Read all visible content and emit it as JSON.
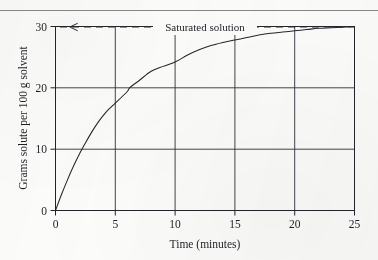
{
  "figure": {
    "background_color": "#fcfcfa",
    "ink_color": "#23232a",
    "top_rule_color": "#6f6f70"
  },
  "chart_data": {
    "type": "line",
    "title": "",
    "subtitle": "",
    "xlabel": "Time (minutes)",
    "ylabel": "Grams solute per 100 g solvent",
    "xlim": [
      0,
      25
    ],
    "ylim": [
      0,
      30
    ],
    "xticks": [
      0,
      5,
      10,
      15,
      20,
      25
    ],
    "xticklabels": [
      "0",
      "5",
      "10",
      "15",
      "20",
      "25"
    ],
    "yticks": [
      0,
      10,
      20,
      30
    ],
    "yticklabels": [
      "0",
      "10",
      "20",
      "30"
    ],
    "grid": {
      "enabled": true,
      "vertical_at": [
        5,
        10,
        15,
        20
      ],
      "horizontal_at": [
        10,
        20
      ],
      "color": "#30303a"
    },
    "legend": {
      "enabled": false,
      "position": "none"
    },
    "series": [
      {
        "name": "Dissolution curve",
        "style": "solid",
        "color": "#26262d",
        "x": [
          0,
          0.5,
          1,
          1.5,
          2,
          2.5,
          3,
          3.5,
          4,
          4.5,
          5,
          6,
          6.2,
          7,
          8,
          9,
          10,
          11,
          12,
          13,
          14,
          15,
          16,
          17,
          18,
          19,
          20,
          21,
          22,
          23,
          24,
          25
        ],
        "y": [
          0,
          2.6,
          5.0,
          7.2,
          9.2,
          11.0,
          12.7,
          14.2,
          15.5,
          16.6,
          17.5,
          19.4,
          20.0,
          21.2,
          22.7,
          23.5,
          24.2,
          25.3,
          26.2,
          26.9,
          27.4,
          27.8,
          28.2,
          28.6,
          28.9,
          29.1,
          29.3,
          29.5,
          29.7,
          29.8,
          29.9,
          30.0
        ]
      },
      {
        "name": "Saturated solution",
        "style": "dashed",
        "color": "#2a2a31",
        "x": [
          0,
          25
        ],
        "y": [
          30,
          30
        ]
      }
    ],
    "annotations": [
      {
        "text": "Saturated solution",
        "x": 12.5,
        "y": 30,
        "arrow": {
          "direction": "left",
          "tip_x": 1.2,
          "tip_y": 30
        }
      }
    ]
  }
}
